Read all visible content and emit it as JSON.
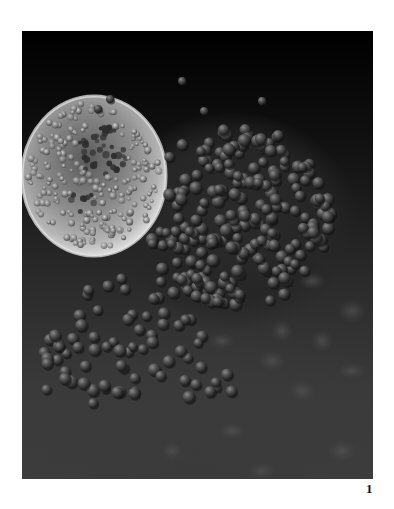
{
  "figure": {
    "label": "1"
  },
  "photo": {
    "colors": {
      "background_top": "#000000",
      "background_bottom": "#3d3d3d",
      "cell_highlight": "#e8e8e8",
      "cell_body": "#8a8a8a",
      "sphere": "#4a4a4a",
      "sphere_shadow": "#1a1a1a",
      "sphere_highlight": "#9a9a9a"
    }
  }
}
